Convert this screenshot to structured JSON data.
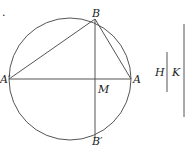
{
  "diagram": {
    "circle": {
      "cx": 70,
      "cy": 79,
      "r": 61
    },
    "points": {
      "A": {
        "label": "A",
        "x": 131,
        "y": 79
      },
      "A_prime": {
        "label": "A′",
        "x": 9,
        "y": 79
      },
      "B": {
        "label": "B",
        "x": 95,
        "y": 19
      },
      "B_prime": {
        "label": "B′",
        "x": 95,
        "y": 138
      },
      "M": {
        "label": "M",
        "x": 95,
        "y": 79
      }
    },
    "segments": [
      [
        "A_prime",
        "A"
      ],
      [
        "B",
        "B_prime"
      ],
      [
        "A_prime",
        "B"
      ],
      [
        "B",
        "A"
      ]
    ],
    "side_lines": {
      "H": {
        "label": "H",
        "x": 167,
        "y1": 52,
        "y2": 92
      },
      "K": {
        "label": "K",
        "x": 184,
        "y1": 24,
        "y2": 117
      }
    },
    "stroke_color": "#555555",
    "mark": "."
  }
}
